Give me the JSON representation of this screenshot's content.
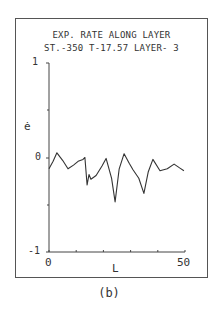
{
  "figure": {
    "title_line1": "EXP. RATE ALONG LAYER",
    "title_line2": "ST.-350 T-17.57 LAYER- 3",
    "caption": "(b)"
  },
  "axes": {
    "ylabel": "ė",
    "xlabel": "L",
    "yticks": [
      "1",
      "0",
      "-1"
    ],
    "xticks": [
      "0",
      "50"
    ]
  },
  "chart_data": {
    "type": "line",
    "title": "EXP. RATE ALONG LAYER",
    "subtitle": "ST.-350 T-17.57 LAYER- 3",
    "xlabel": "L",
    "ylabel": "ė",
    "xlim": [
      0,
      50
    ],
    "ylim": [
      -1,
      1
    ],
    "xtick_positions": [
      0,
      10,
      20,
      30,
      40,
      50
    ],
    "xtick_labels": [
      "0",
      "50"
    ],
    "ytick_positions": [
      -1,
      0,
      1
    ],
    "ytick_labels": [
      "-1",
      "0",
      "1"
    ],
    "grid": false,
    "legend": null,
    "series": [
      {
        "name": "expansion rate",
        "x": [
          0,
          1.5,
          2.9,
          5.0,
          7.0,
          9.0,
          10.7,
          12.5,
          13.2,
          14.0,
          14.7,
          15.4,
          17.3,
          19.5,
          21.0,
          23.0,
          24.3,
          25.8,
          27.6,
          29.5,
          30.9,
          33.0,
          34.9,
          36.5,
          38.2,
          40.8,
          43.5,
          46.0,
          48.0,
          49.6
        ],
        "values": [
          -0.12,
          -0.04,
          0.05,
          -0.03,
          -0.12,
          -0.08,
          -0.04,
          -0.02,
          0.0,
          -0.29,
          -0.18,
          -0.23,
          -0.19,
          -0.09,
          -0.01,
          -0.22,
          -0.47,
          -0.12,
          0.04,
          -0.06,
          -0.13,
          -0.22,
          -0.38,
          -0.15,
          -0.02,
          -0.14,
          -0.12,
          -0.07,
          -0.11,
          -0.14
        ]
      }
    ]
  }
}
